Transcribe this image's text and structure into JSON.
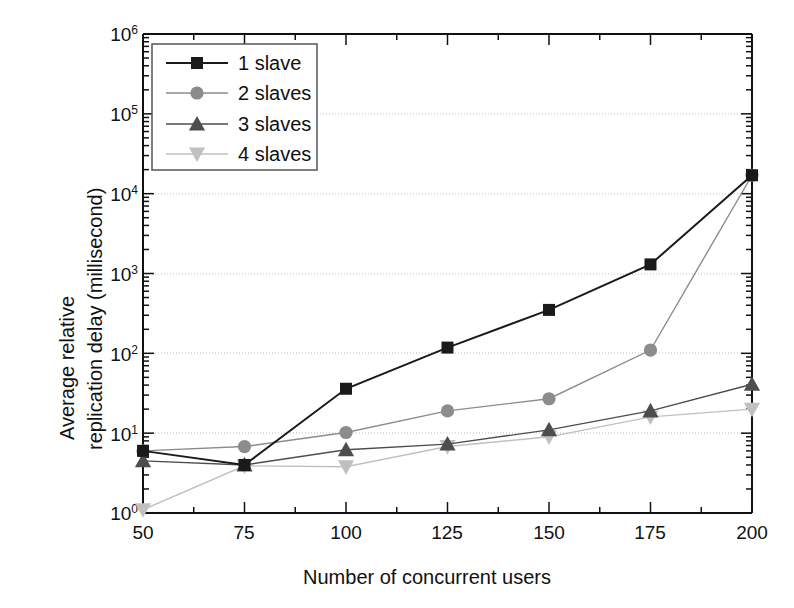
{
  "chart_data": {
    "type": "line",
    "title": "",
    "xlabel": "Number of concurrent users",
    "ylabel_line1": "Average relative",
    "ylabel_line2": "replication delay (millisecond)",
    "x": [
      50,
      75,
      100,
      125,
      150,
      175,
      200
    ],
    "xlim": [
      50,
      200
    ],
    "xticks": [
      "50",
      "75",
      "100",
      "125",
      "150",
      "175",
      "200"
    ],
    "yscale": "log",
    "ylim": [
      1,
      1000000
    ],
    "yticks": [
      "10",
      "10",
      "10",
      "10",
      "10",
      "10",
      "10"
    ],
    "yexponents": [
      "0",
      "1",
      "2",
      "3",
      "4",
      "5",
      "6"
    ],
    "grid": "horizontal-dotted",
    "legend_position": "top-left",
    "series": [
      {
        "name": "1 slave",
        "marker": "square",
        "color": "#1a1a1a",
        "values": [
          6.0,
          4.0,
          36.0,
          118.0,
          350.0,
          1300.0,
          17000.0
        ]
      },
      {
        "name": "2 slaves",
        "marker": "circle",
        "color": "#8c8c8c",
        "values": [
          6.0,
          6.8,
          10.2,
          19.0,
          27.0,
          110.0,
          17000.0
        ]
      },
      {
        "name": "3 slaves",
        "marker": "triangle-up",
        "color": "#4d4d4d",
        "values": [
          4.5,
          4.0,
          6.2,
          7.3,
          11.0,
          19.0,
          41.0
        ]
      },
      {
        "name": "4 slaves",
        "marker": "triangle-down",
        "color": "#c0c0c0",
        "values": [
          1.1,
          3.9,
          3.8,
          6.8,
          9.0,
          16.0,
          20.0
        ]
      }
    ]
  },
  "legend": {
    "items": [
      {
        "label": "1 slave"
      },
      {
        "label": "2 slaves"
      },
      {
        "label": "3 slaves"
      },
      {
        "label": "4 slaves"
      }
    ]
  }
}
